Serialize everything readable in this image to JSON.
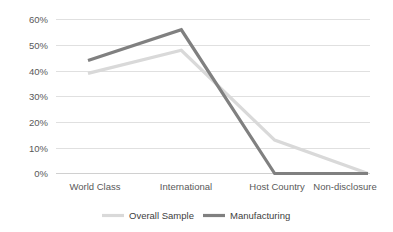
{
  "chart_data": {
    "type": "line",
    "title": "",
    "xlabel": "",
    "ylabel": "",
    "categories": [
      "World Class",
      "International",
      "Host Country",
      "Non-disclosure"
    ],
    "series": [
      {
        "name": "Overall Sample",
        "color": "#D9D9D9",
        "values": [
          0.39,
          0.48,
          0.13,
          0.0
        ]
      },
      {
        "name": "Manufacturing",
        "color": "#808080",
        "values": [
          0.44,
          0.56,
          0.0,
          0.0
        ]
      }
    ],
    "ylim": [
      0,
      0.6
    ],
    "ytick_values": [
      0.0,
      0.1,
      0.2,
      0.3,
      0.4,
      0.5,
      0.6
    ],
    "ytick_labels": [
      "0%",
      "10%",
      "20%",
      "30%",
      "40%",
      "50%",
      "60%"
    ],
    "grid": true,
    "legend_position": "bottom"
  },
  "axes": {
    "y_ticks": [
      {
        "label": "60%",
        "value": 0.6
      },
      {
        "label": "50%",
        "value": 0.5
      },
      {
        "label": "40%",
        "value": 0.4
      },
      {
        "label": "30%",
        "value": 0.3
      },
      {
        "label": "20%",
        "value": 0.2
      },
      {
        "label": "10%",
        "value": 0.1
      },
      {
        "label": "0%",
        "value": 0.0
      }
    ],
    "x_ticks": [
      {
        "label": "World Class"
      },
      {
        "label": "International"
      },
      {
        "label": "Host Country"
      },
      {
        "label": "Non-disclosure"
      }
    ]
  },
  "legend": {
    "items": [
      {
        "label": "Overall Sample",
        "color": "#D9D9D9"
      },
      {
        "label": "Manufacturing",
        "color": "#808080"
      }
    ]
  },
  "colors": {
    "background": "#FFFFFF",
    "gridline": "#E0E0E0",
    "tick_text": "#595959",
    "legend_text": "#404040",
    "series_overall_sample": "#D9D9D9",
    "series_manufacturing": "#808080"
  }
}
